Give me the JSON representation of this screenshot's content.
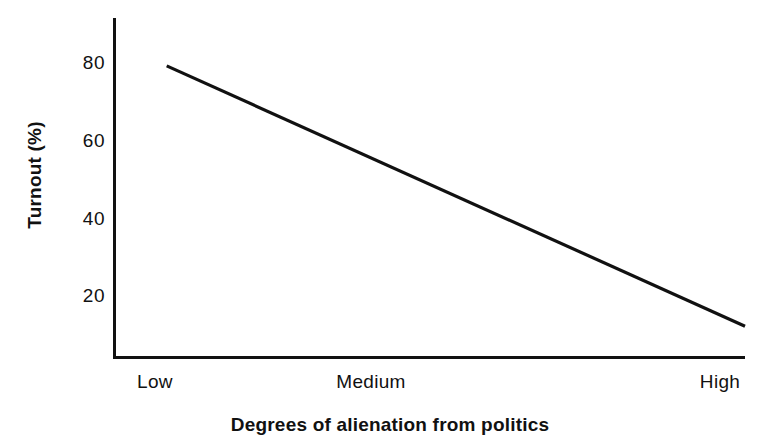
{
  "chart_data": {
    "type": "line",
    "title": "",
    "subtitle": "",
    "xlabel": "Degrees of alienation from politics",
    "ylabel": "Turnout (%)",
    "categories": [
      "Low",
      "Medium",
      "High"
    ],
    "x": [
      0,
      1,
      2
    ],
    "xtick_labels": [
      "Low",
      "Medium",
      "High"
    ],
    "ytick_labels": [
      "20",
      "40",
      "60",
      "80"
    ],
    "yticks": [
      20,
      40,
      60,
      80
    ],
    "xlim": [
      0,
      2
    ],
    "ylim": [
      4,
      87
    ],
    "grid": false,
    "legend": false,
    "legend_position": "none",
    "series": [
      {
        "name": "Turnout",
        "color": "#111111",
        "x": [
          0.17,
          2.0
        ],
        "values": [
          79,
          12
        ],
        "points": [
          {
            "x_label": "Low",
            "y": 79
          },
          {
            "x_label": "High",
            "y": 12
          }
        ],
        "annotation": "Straight downward-sloping line from about 79% turnout at low alienation to about 12% at high alienation"
      }
    ],
    "axis_color": "#111111",
    "background_color": "#ffffff"
  },
  "figure": {
    "background_color": "#ffffff",
    "axis_color": "#111111"
  }
}
